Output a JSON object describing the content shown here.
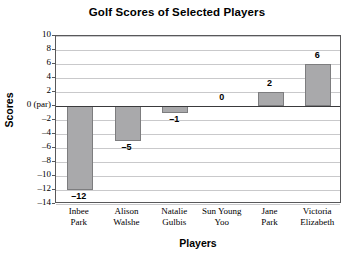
{
  "chart_data": {
    "type": "bar",
    "title": "Golf Scores of Selected Players",
    "xlabel": "Players",
    "ylabel": "Scores",
    "categories": [
      "Inbee Park",
      "Alison Walshe",
      "Natalie Gulbis",
      "Sun Young Yoo",
      "Jane Park",
      "Victoria Elizabeth"
    ],
    "category_lines": [
      [
        "Inbee",
        "Park"
      ],
      [
        "Alison",
        "Walshe"
      ],
      [
        "Natalie",
        "Gulbis"
      ],
      [
        "Sun Young",
        "Yoo"
      ],
      [
        "Jane",
        "Park"
      ],
      [
        "Victoria",
        "Elizabeth"
      ]
    ],
    "values": [
      -12,
      -5,
      -1,
      0,
      2,
      6
    ],
    "value_labels": [
      "–12",
      "–5",
      "–1",
      "0",
      "2",
      "6"
    ],
    "ylim": [
      -14,
      10
    ],
    "ytick_values": [
      10,
      8,
      6,
      4,
      2,
      0,
      -2,
      -4,
      -6,
      -8,
      -10,
      -12,
      -14
    ],
    "ytick_labels": [
      "10",
      "8",
      "6",
      "4",
      "2",
      "0 (par)",
      "–2",
      "–4",
      "–6",
      "–8",
      "–10",
      "–12",
      "–14"
    ],
    "grid": true,
    "legend": "none",
    "bar_color": "#a9a9ab",
    "bar_edge_color": "#7d7d7f",
    "zero_line_color": "#3a3a3c",
    "grid_color": "#c9c9cb",
    "axis_color": "#58585a",
    "background": "#ffffff"
  }
}
